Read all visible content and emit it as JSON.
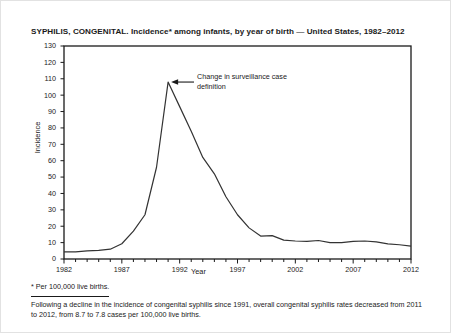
{
  "figure": {
    "title": "SYPHILIS, CONGENITAL. Incidence* among infants, by year of birth — United States, 1982–2012",
    "annotation": "Change in surveillance case definition",
    "footnote_symbol": "* Per 100,000 live births.",
    "footnote_body": "Following a decline in the incidence of congenital syphilis since 1991, overall congenital syphilis rates decreased from 2011 to 2012, from 8.7 to 7.8 cases per 100,000 live births.",
    "line_color": "#333333",
    "axis_color": "#1a1a1a",
    "background": "#ffffff"
  },
  "chart_data": {
    "type": "line",
    "title": "SYPHILIS, CONGENITAL. Incidence* among infants, by year of birth — United States, 1982–2012",
    "xlabel": "Year",
    "ylabel": "Incidence",
    "xlim": [
      1982,
      2012
    ],
    "ylim": [
      0,
      130
    ],
    "ytick_step": 10,
    "yticks": [
      0,
      10,
      20,
      30,
      40,
      50,
      60,
      70,
      80,
      90,
      100,
      110,
      120,
      130
    ],
    "xticks_major": [
      1982,
      1987,
      1992,
      1997,
      2002,
      2007,
      2012
    ],
    "xtick_step_minor": 1,
    "grid": false,
    "legend": "none",
    "annotations": [
      {
        "text": "Change in surveillance case definition",
        "points_to_x": 1991,
        "points_to_y": 108
      }
    ],
    "x": [
      1982,
      1983,
      1984,
      1985,
      1986,
      1987,
      1988,
      1989,
      1990,
      1991,
      1992,
      1993,
      1994,
      1995,
      1996,
      1997,
      1998,
      1999,
      2000,
      2001,
      2002,
      2003,
      2004,
      2005,
      2006,
      2007,
      2008,
      2009,
      2010,
      2011,
      2012
    ],
    "y": [
      4.3,
      4.3,
      5.0,
      5.3,
      6.0,
      9.3,
      17.0,
      27.0,
      56.0,
      108.0,
      93.0,
      78.0,
      62.0,
      52.0,
      38.0,
      27.0,
      19.0,
      14.0,
      14.3,
      11.5,
      11.0,
      10.7,
      11.3,
      10.0,
      10.0,
      10.8,
      11.0,
      10.4,
      9.2,
      8.7,
      7.8
    ],
    "series_name": "Congenital syphilis incidence per 100,000 live births"
  }
}
